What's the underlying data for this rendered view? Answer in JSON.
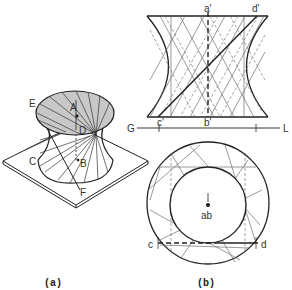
{
  "figure": {
    "colors": {
      "line": "#222222",
      "thin": "#555555",
      "shade": "#c8c8c8",
      "background": "#ffffff"
    }
  },
  "panel_a": {
    "caption": "(a)",
    "labels": {
      "E": "E",
      "A": "A",
      "D": "D",
      "C": "C",
      "B": "B",
      "F": "F"
    }
  },
  "panel_b": {
    "caption": "(b)",
    "front_view": {
      "labels": {
        "a_prime": "a'",
        "d_prime": "d'",
        "c_prime": "c'",
        "b_prime": "b'",
        "G": "G",
        "L": "L"
      }
    },
    "top_view": {
      "labels": {
        "ab": "ab",
        "c": "c",
        "d": "d"
      }
    }
  }
}
